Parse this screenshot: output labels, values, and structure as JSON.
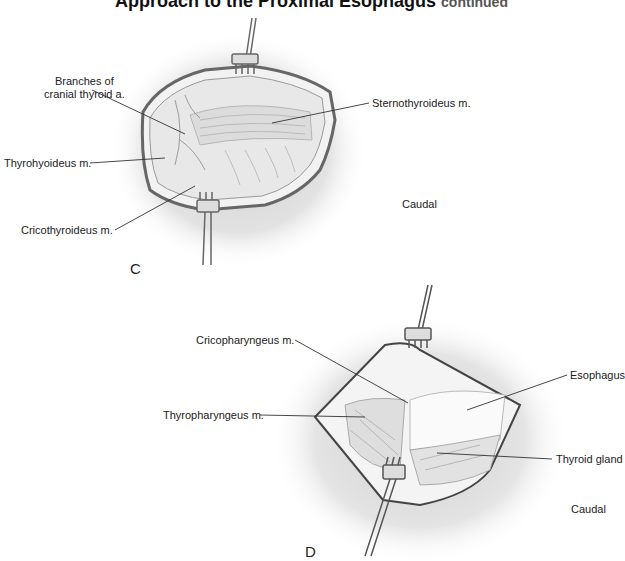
{
  "title": {
    "main": "Approach to the Proximal Esophagus",
    "suffix": "continued"
  },
  "panels": [
    {
      "letter": "C",
      "orientation": "Caudal",
      "labels": [
        {
          "text_line1": "Branches of",
          "text_line2": "cranial thyroid a."
        },
        {
          "text": "Sternothyroideus m."
        },
        {
          "text": "Thyrohyoideus m."
        },
        {
          "text": "Cricothyroideus m."
        }
      ]
    },
    {
      "letter": "D",
      "orientation": "Caudal",
      "labels": [
        {
          "text": "Cricopharyngeus m."
        },
        {
          "text": "Esophagus"
        },
        {
          "text": "Thyropharyngeus m."
        },
        {
          "text": "Thyroid gland"
        }
      ]
    }
  ]
}
